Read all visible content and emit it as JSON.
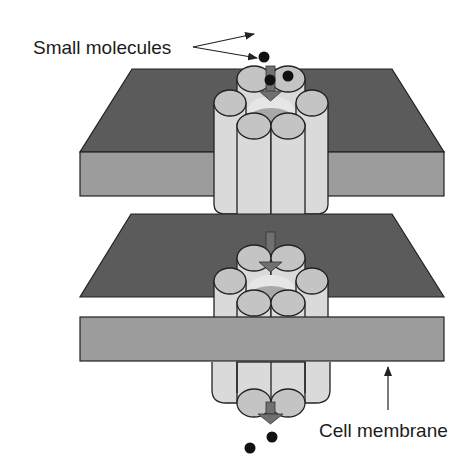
{
  "diagram": {
    "type": "channel-protein-across-membranes",
    "labels": {
      "small_molecules": "Small molecules",
      "cell_membrane": "Cell membrane"
    },
    "colors": {
      "membrane_top": "#5b5b5b",
      "membrane_front": "#9c9c9c",
      "channel_body": "#dadada",
      "channel_cap": "#c4c4c4",
      "channel_pore": "#a8a8a8",
      "arrow": "#707070",
      "molecule": "#111111",
      "outline": "#222222"
    },
    "molecules": {
      "entering": [
        [
          265,
          57
        ],
        [
          270,
          80
        ],
        [
          288,
          77
        ]
      ],
      "exiting": [
        [
          271,
          437
        ],
        [
          249,
          447
        ]
      ]
    }
  }
}
